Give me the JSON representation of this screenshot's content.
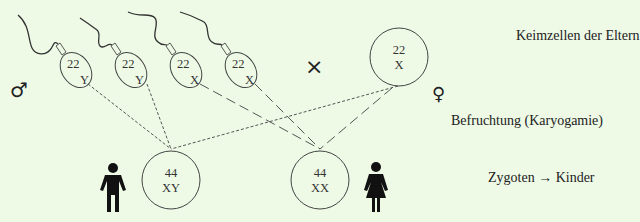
{
  "colors": {
    "background": "#eefae6",
    "stroke": "#444444",
    "text": "#222222",
    "figure": "#111111"
  },
  "symbols": {
    "male": "♂",
    "female": "♀",
    "cross": "×"
  },
  "sperm_cells": [
    {
      "autosomes": "22",
      "sex_chromosome": "Y"
    },
    {
      "autosomes": "22",
      "sex_chromosome": "Y"
    },
    {
      "autosomes": "22",
      "sex_chromosome": "X"
    },
    {
      "autosomes": "22",
      "sex_chromosome": "X"
    }
  ],
  "egg_cell": {
    "autosomes": "22",
    "sex_chromosome": "X"
  },
  "zygotes": [
    {
      "autosomes": "44",
      "sex_chromosomes": "XY",
      "child": "male-figure"
    },
    {
      "autosomes": "44",
      "sex_chromosomes": "XX",
      "child": "female-figure"
    }
  ],
  "labels": {
    "gametes": "Keimzellen der Eltern",
    "fertilization": "Befruchtung (Karyogamie)",
    "zygotes": "Zygoten → Kinder"
  }
}
